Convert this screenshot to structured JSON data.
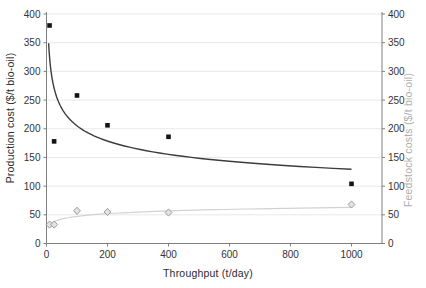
{
  "chart_data": {
    "type": "scatter",
    "title": "",
    "xlabel": "Throughput (t/day)",
    "ylabel_left": "Production cost ($/t bio-oil)",
    "ylabel_right": "Feedstock costs ($/t bio-oil)",
    "xlim": [
      0,
      1100
    ],
    "ylim_left": [
      0,
      400
    ],
    "ylim_right": [
      0,
      400
    ],
    "x_ticks": [
      0,
      200,
      400,
      600,
      800,
      1000
    ],
    "y_ticks_left": [
      0,
      50,
      100,
      150,
      200,
      250,
      300,
      350,
      400
    ],
    "y_ticks_right": [
      0,
      50,
      100,
      150,
      200,
      250,
      300,
      350,
      400
    ],
    "grid": "horizontal",
    "legend": "none",
    "series": [
      {
        "name": "Production cost",
        "axis": "left",
        "marker": "filled-square",
        "color": "#141414",
        "points": [
          [
            10,
            380
          ],
          [
            25,
            178
          ],
          [
            100,
            258
          ],
          [
            200,
            206
          ],
          [
            400,
            186
          ],
          [
            1000,
            104
          ]
        ]
      },
      {
        "name": "Feedstock costs",
        "axis": "right",
        "marker": "open-diamond",
        "color": "#9b9b9b",
        "fill": "#e3e3e3",
        "points": [
          [
            10,
            33
          ],
          [
            25,
            33
          ],
          [
            100,
            57
          ],
          [
            200,
            55
          ],
          [
            400,
            54
          ],
          [
            1000,
            68
          ]
        ]
      }
    ],
    "trendlines": [
      {
        "series": "Production cost",
        "fit": "power",
        "equation": "y = 515 * x^(-0.2)",
        "a": 515,
        "b": -0.2,
        "x_range": [
          7,
          1000
        ],
        "color": "#3c3c3c"
      },
      {
        "series": "Feedstock costs",
        "fit": "logarithmic",
        "equation": "y = 16 + 6.8 * ln(x)",
        "a": 16,
        "b": 6.8,
        "x_range": [
          8,
          1000
        ],
        "color": "#d2d2d2"
      }
    ],
    "style": {
      "axis_color": "#7f7f7f",
      "grid_color": "#e5e5e5",
      "tick_label_color": "#333333"
    }
  }
}
